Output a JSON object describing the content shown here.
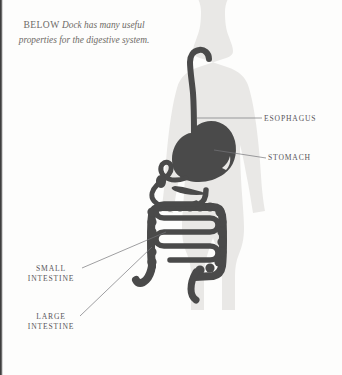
{
  "figure": {
    "kind": "anatomical-illustration",
    "caption": {
      "kicker": "BELOW",
      "text": "Dock has many useful properties for the digestive system."
    },
    "colors": {
      "background": "#fdfdfc",
      "body_silhouette": "#e9e8e6",
      "organ_fill": "#4a4a4a",
      "leader_line": "#76757a",
      "label_text": "#58565a",
      "caption_text": "#6d6a66"
    },
    "labels": [
      {
        "id": "esophagus",
        "line1": "ESOPHAGUS",
        "line2": ""
      },
      {
        "id": "stomach",
        "line1": "STOMACH",
        "line2": ""
      },
      {
        "id": "small-intestine",
        "line1": "SMALL",
        "line2": "INTESTINE"
      },
      {
        "id": "large-intestine",
        "line1": "LARGE",
        "line2": "INTESTINE"
      }
    ]
  }
}
